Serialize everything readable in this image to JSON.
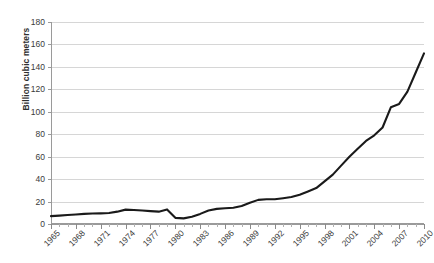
{
  "chart_data": {
    "type": "line",
    "title": "",
    "xlabel": "",
    "ylabel": "Billion cubic meters",
    "ylim": [
      0,
      180
    ],
    "xlim": [
      1965,
      2010
    ],
    "grid": true,
    "legend": false,
    "y_ticks": [
      0,
      20,
      40,
      60,
      80,
      100,
      120,
      140,
      160,
      180
    ],
    "x_tick_labels": [
      "1965",
      "1968",
      "1971",
      "1974",
      "1977",
      "1980",
      "1983",
      "1986",
      "1989",
      "1992",
      "1995",
      "1998",
      "2001",
      "2004",
      "2007",
      "2010"
    ],
    "x": [
      1965,
      1966,
      1967,
      1968,
      1969,
      1970,
      1971,
      1972,
      1973,
      1974,
      1975,
      1976,
      1977,
      1978,
      1979,
      1980,
      1981,
      1982,
      1983,
      1984,
      1985,
      1986,
      1987,
      1988,
      1989,
      1990,
      1991,
      1992,
      1993,
      1994,
      1995,
      1996,
      1997,
      1998,
      1999,
      2000,
      2001,
      2002,
      2003,
      2004,
      2005,
      2006,
      2007,
      2008,
      2009,
      2010
    ],
    "series": [
      {
        "name": "Billion cubic meters",
        "color": "#1a1a1a",
        "values": [
          7,
          7.5,
          8,
          8.5,
          9,
          9.3,
          9.5,
          9.8,
          11,
          12.8,
          12.5,
          12,
          11.5,
          11,
          13,
          5.5,
          5,
          6.5,
          9,
          12,
          13.5,
          14,
          14.5,
          16,
          19,
          21.5,
          22,
          22,
          23,
          24,
          26,
          29,
          32,
          38,
          44,
          52,
          60,
          67,
          74,
          79,
          86,
          104,
          107,
          118,
          135,
          152
        ]
      }
    ]
  },
  "axis": {
    "y_title": "Billion cubic meters"
  }
}
